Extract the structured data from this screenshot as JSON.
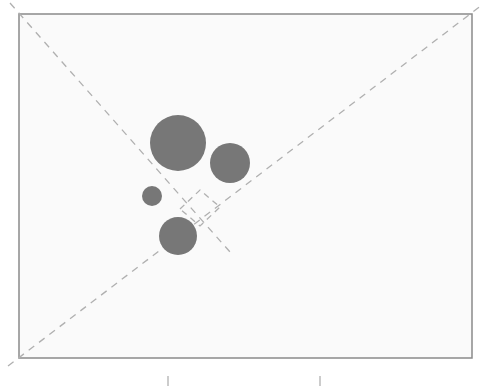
{
  "diagram": {
    "background": "#ffffff",
    "frame": {
      "x": 19,
      "y": 14,
      "width": 453,
      "height": 344,
      "stroke": "#8a8a8a",
      "fill": "#fafafa"
    },
    "diagonals": [
      {
        "x1": 10,
        "y1": 3,
        "x2": 230,
        "y2": 252,
        "color": "#b0b0b0",
        "note": "top-left diagonal, partial"
      },
      {
        "x1": 8,
        "y1": 366,
        "x2": 482,
        "y2": 5,
        "color": "#b0b0b0",
        "note": "bottom-left to top-right diagonal"
      }
    ],
    "circles": [
      {
        "name": "large-circle",
        "cx": 178,
        "cy": 143,
        "r": 28,
        "fill": "#777777"
      },
      {
        "name": "right-circle",
        "cx": 230,
        "cy": 163,
        "r": 20,
        "fill": "#777777"
      },
      {
        "name": "small-circle",
        "cx": 152,
        "cy": 196,
        "r": 10,
        "fill": "#777777"
      },
      {
        "name": "bottom-circle",
        "cx": 178,
        "cy": 236,
        "r": 19,
        "fill": "#777777"
      }
    ],
    "marker_square": {
      "points": "180,209 200,190 220,207 200,226",
      "color": "#b0b0b0"
    },
    "ticks": [
      {
        "x": 168,
        "y1": 376,
        "y2": 386
      },
      {
        "x": 320,
        "y1": 376,
        "y2": 386
      }
    ]
  }
}
